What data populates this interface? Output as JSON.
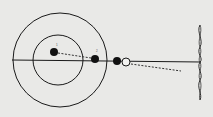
{
  "diagram": {
    "type": "orbital-schematic",
    "background": "#e9e9e7",
    "ink": "#1a1a1a",
    "orbits": [
      {
        "name": "outer-orbit",
        "cx": 60,
        "cy": 60,
        "r": 47
      },
      {
        "name": "inner-orbit",
        "cx": 58,
        "cy": 60,
        "r": 25
      }
    ],
    "axis": {
      "x1": 12,
      "y1": 60,
      "x2": 201,
      "y2": 62
    },
    "bodies": [
      {
        "name": "body-1",
        "label": "1",
        "cx": 54,
        "cy": 52,
        "r": 4,
        "filled": true
      },
      {
        "name": "body-2",
        "label": "2",
        "cx": 95,
        "cy": 59,
        "r": 4,
        "filled": true
      },
      {
        "name": "body-3",
        "label": "",
        "cx": 117,
        "cy": 61,
        "r": 4,
        "filled": true
      },
      {
        "name": "body-4-hollow",
        "label": "",
        "cx": 126,
        "cy": 62,
        "r": 4,
        "filled": false
      }
    ],
    "dashed_paths": [
      {
        "name": "path-1-to-2",
        "x1": 58,
        "y1": 53,
        "x2": 91,
        "y2": 58
      },
      {
        "name": "path-hollow-outward",
        "x1": 131,
        "y1": 64,
        "x2": 181,
        "y2": 71
      }
    ],
    "wave": {
      "name": "wavefront-screen",
      "x": 200,
      "y_top": 25,
      "y_bottom": 100
    }
  }
}
